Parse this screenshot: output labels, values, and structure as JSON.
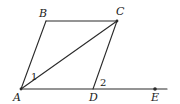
{
  "diagram": {
    "type": "geometry",
    "points": {
      "A": {
        "label": "A",
        "x": 21,
        "y": 89
      },
      "B": {
        "label": "B",
        "x": 46,
        "y": 21
      },
      "C": {
        "label": "C",
        "x": 117,
        "y": 21
      },
      "D": {
        "label": "D",
        "x": 93,
        "y": 89
      },
      "E": {
        "label": "E",
        "x": 155,
        "y": 89
      }
    },
    "segments": [
      [
        "A",
        "B"
      ],
      [
        "B",
        "C"
      ],
      [
        "C",
        "D"
      ],
      [
        "A",
        "C"
      ],
      [
        "A",
        "E"
      ]
    ],
    "angle_labels": [
      {
        "label": "1",
        "at": "A",
        "between": [
          "AB",
          "AC"
        ]
      },
      {
        "label": "2",
        "at": "D",
        "between": [
          "DC",
          "DE"
        ]
      }
    ],
    "colors": {
      "stroke": "#2a2a2a",
      "text": "#1a1a1a",
      "background": "#ffffff"
    }
  }
}
